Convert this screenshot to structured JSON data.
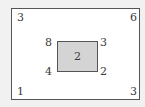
{
  "diagram": {
    "outer_rectangle": {
      "corners": {
        "top_left": "3",
        "top_right": "6",
        "bottom_left": "1",
        "bottom_right": "3"
      },
      "fill": "#ffffff",
      "border": "#555555"
    },
    "inner_rectangle": {
      "center": "2",
      "corners": {
        "top_left": "8",
        "top_right": "3",
        "bottom_left": "4",
        "bottom_right": "2"
      },
      "fill": "#d4d4d4",
      "border": "#555555"
    }
  }
}
